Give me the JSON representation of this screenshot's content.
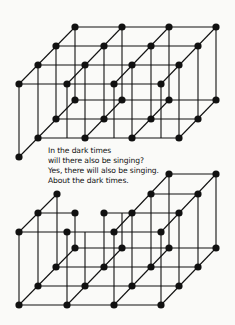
{
  "poem": {
    "lines": [
      "In the dark times",
      "will there also be singing?",
      "Yes, there will also be singing.",
      "About the dark times."
    ]
  },
  "colors": {
    "background": "#fafaf8",
    "ink": "#111111"
  },
  "figures": [
    {
      "name": "top-lattice",
      "description": "complete 4x4x2 cubic lattice"
    },
    {
      "name": "bottom-lattice",
      "description": "cubic lattice with missing top nodes"
    }
  ]
}
